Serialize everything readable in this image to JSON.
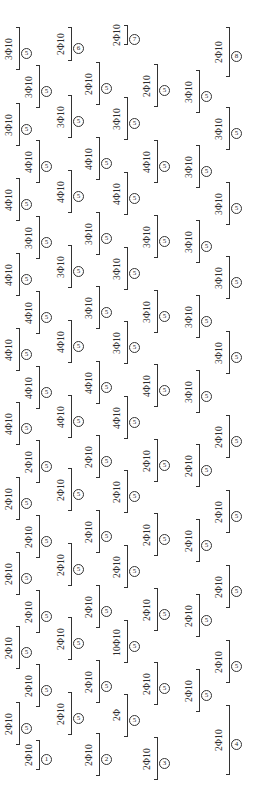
{
  "drawing": {
    "title": "",
    "bars": [
      {
        "x": 16,
        "y": 27,
        "h": 43,
        "label": "3Φ10",
        "mark": "5"
      },
      {
        "x": 36,
        "y": 65,
        "h": 43,
        "label": "3Φ10",
        "mark": "5"
      },
      {
        "x": 16,
        "y": 103,
        "h": 43,
        "label": "3Φ10",
        "mark": "5"
      },
      {
        "x": 36,
        "y": 140,
        "h": 43,
        "label": "4Φ10",
        "mark": "5"
      },
      {
        "x": 16,
        "y": 178,
        "h": 43,
        "label": "4Φ10",
        "mark": "5"
      },
      {
        "x": 36,
        "y": 216,
        "h": 43,
        "label": "3Φ10",
        "mark": "5"
      },
      {
        "x": 16,
        "y": 253,
        "h": 43,
        "label": "4Φ10",
        "mark": "5"
      },
      {
        "x": 36,
        "y": 291,
        "h": 43,
        "label": "4Φ10",
        "mark": "5"
      },
      {
        "x": 16,
        "y": 328,
        "h": 43,
        "label": "4Φ10",
        "mark": "5"
      },
      {
        "x": 36,
        "y": 366,
        "h": 43,
        "label": "4Φ10",
        "mark": "5"
      },
      {
        "x": 16,
        "y": 402,
        "h": 43,
        "label": "4Φ10",
        "mark": "5"
      },
      {
        "x": 36,
        "y": 440,
        "h": 43,
        "label": "2Φ10",
        "mark": "5"
      },
      {
        "x": 16,
        "y": 477,
        "h": 43,
        "label": "2Φ10",
        "mark": "5"
      },
      {
        "x": 36,
        "y": 515,
        "h": 43,
        "label": "2Φ10",
        "mark": "5"
      },
      {
        "x": 16,
        "y": 552,
        "h": 43,
        "label": "2Φ10",
        "mark": "5"
      },
      {
        "x": 36,
        "y": 590,
        "h": 43,
        "label": "2Φ10",
        "mark": "5"
      },
      {
        "x": 16,
        "y": 626,
        "h": 43,
        "label": "2Φ10",
        "mark": "5"
      },
      {
        "x": 36,
        "y": 664,
        "h": 43,
        "label": "2Φ10",
        "mark": "5"
      },
      {
        "x": 16,
        "y": 702,
        "h": 43,
        "label": "2Φ10",
        "mark": "5"
      },
      {
        "x": 36,
        "y": 740,
        "h": 30,
        "label": "2Φ10",
        "mark": "1"
      },
      {
        "x": 68,
        "y": 27,
        "h": 34,
        "label": "2Φ10",
        "mark": "6"
      },
      {
        "x": 68,
        "y": 95,
        "h": 43,
        "label": "3Φ10",
        "mark": "5"
      },
      {
        "x": 68,
        "y": 170,
        "h": 43,
        "label": "4Φ10",
        "mark": "5"
      },
      {
        "x": 68,
        "y": 245,
        "h": 43,
        "label": "3Φ10",
        "mark": "5"
      },
      {
        "x": 68,
        "y": 320,
        "h": 43,
        "label": "4Φ10",
        "mark": "5"
      },
      {
        "x": 68,
        "y": 395,
        "h": 43,
        "label": "4Φ10",
        "mark": "5"
      },
      {
        "x": 68,
        "y": 468,
        "h": 43,
        "label": "2Φ10",
        "mark": "5"
      },
      {
        "x": 68,
        "y": 543,
        "h": 43,
        "label": "2Φ10",
        "mark": "5"
      },
      {
        "x": 68,
        "y": 617,
        "h": 43,
        "label": "2Φ10",
        "mark": "5"
      },
      {
        "x": 68,
        "y": 692,
        "h": 43,
        "label": "2Φ10",
        "mark": "5"
      },
      {
        "x": 96,
        "y": 62,
        "h": 43,
        "label": "2Φ10",
        "mark": "5"
      },
      {
        "x": 96,
        "y": 137,
        "h": 43,
        "label": "4Φ10",
        "mark": "5"
      },
      {
        "x": 96,
        "y": 212,
        "h": 43,
        "label": "3Φ10",
        "mark": "5"
      },
      {
        "x": 96,
        "y": 286,
        "h": 43,
        "label": "3Φ10",
        "mark": "5"
      },
      {
        "x": 96,
        "y": 361,
        "h": 43,
        "label": "4Φ10",
        "mark": "5"
      },
      {
        "x": 96,
        "y": 435,
        "h": 43,
        "label": "2Φ10",
        "mark": "5"
      },
      {
        "x": 96,
        "y": 510,
        "h": 43,
        "label": "2Φ10",
        "mark": "5"
      },
      {
        "x": 96,
        "y": 585,
        "h": 43,
        "label": "2Φ10",
        "mark": "5"
      },
      {
        "x": 96,
        "y": 660,
        "h": 43,
        "label": "2Φ10",
        "mark": "5"
      },
      {
        "x": 96,
        "y": 733,
        "h": 43,
        "label": "2Φ10",
        "mark": "2"
      },
      {
        "x": 124,
        "y": 25,
        "h": 20,
        "label": "2Φ10",
        "mark": "7"
      },
      {
        "x": 124,
        "y": 97,
        "h": 43,
        "label": "3Φ10",
        "mark": "5"
      },
      {
        "x": 124,
        "y": 172,
        "h": 43,
        "label": "4Φ10",
        "mark": "5"
      },
      {
        "x": 124,
        "y": 247,
        "h": 43,
        "label": "3Φ10",
        "mark": "5"
      },
      {
        "x": 124,
        "y": 321,
        "h": 43,
        "label": "3Φ10",
        "mark": "5"
      },
      {
        "x": 124,
        "y": 396,
        "h": 43,
        "label": "4Φ10",
        "mark": "5"
      },
      {
        "x": 124,
        "y": 470,
        "h": 43,
        "label": "2Φ10",
        "mark": "5"
      },
      {
        "x": 124,
        "y": 545,
        "h": 43,
        "label": "2Φ10",
        "mark": "5"
      },
      {
        "x": 124,
        "y": 620,
        "h": 43,
        "label": "10Φ10",
        "mark": "5"
      },
      {
        "x": 124,
        "y": 694,
        "h": 43,
        "label": "2Φ",
        "mark": "5"
      },
      {
        "x": 154,
        "y": 64,
        "h": 43,
        "label": "2Φ10",
        "mark": "5"
      },
      {
        "x": 154,
        "y": 140,
        "h": 43,
        "label": "4Φ10",
        "mark": "5"
      },
      {
        "x": 154,
        "y": 215,
        "h": 43,
        "label": "3Φ10",
        "mark": "5"
      },
      {
        "x": 154,
        "y": 290,
        "h": 43,
        "label": "3Φ10",
        "mark": "5"
      },
      {
        "x": 154,
        "y": 364,
        "h": 43,
        "label": "4Φ10",
        "mark": "5"
      },
      {
        "x": 154,
        "y": 439,
        "h": 43,
        "label": "2Φ10",
        "mark": "5"
      },
      {
        "x": 154,
        "y": 513,
        "h": 43,
        "label": "2Φ10",
        "mark": "5"
      },
      {
        "x": 154,
        "y": 588,
        "h": 43,
        "label": "2Φ10",
        "mark": "5"
      },
      {
        "x": 154,
        "y": 662,
        "h": 43,
        "label": "2Φ10",
        "mark": "5"
      },
      {
        "x": 154,
        "y": 737,
        "h": 43,
        "label": "2Φ10",
        "mark": "3"
      },
      {
        "x": 196,
        "y": 70,
        "h": 43,
        "label": "3Φ10",
        "mark": "5"
      },
      {
        "x": 196,
        "y": 145,
        "h": 43,
        "label": "3Φ10",
        "mark": "5"
      },
      {
        "x": 196,
        "y": 220,
        "h": 43,
        "label": "3Φ10",
        "mark": "5"
      },
      {
        "x": 196,
        "y": 295,
        "h": 43,
        "label": "3Φ10",
        "mark": "5"
      },
      {
        "x": 196,
        "y": 370,
        "h": 43,
        "label": "3Φ10",
        "mark": "5"
      },
      {
        "x": 196,
        "y": 444,
        "h": 43,
        "label": "2Φ10",
        "mark": "5"
      },
      {
        "x": 196,
        "y": 519,
        "h": 43,
        "label": "2Φ10",
        "mark": "5"
      },
      {
        "x": 196,
        "y": 594,
        "h": 43,
        "label": "2Φ10",
        "mark": "5"
      },
      {
        "x": 196,
        "y": 669,
        "h": 43,
        "label": "2Φ10",
        "mark": "5"
      },
      {
        "x": 226,
        "y": 27,
        "h": 50,
        "label": "2Φ10",
        "mark": "8"
      },
      {
        "x": 226,
        "y": 107,
        "h": 43,
        "label": "3Φ10",
        "mark": "5"
      },
      {
        "x": 226,
        "y": 182,
        "h": 43,
        "label": "3Φ10",
        "mark": "5"
      },
      {
        "x": 226,
        "y": 256,
        "h": 43,
        "label": "3Φ10",
        "mark": "5"
      },
      {
        "x": 226,
        "y": 331,
        "h": 43,
        "label": "3Φ10",
        "mark": "5"
      },
      {
        "x": 226,
        "y": 415,
        "h": 43,
        "label": "2Φ10",
        "mark": "5"
      },
      {
        "x": 226,
        "y": 490,
        "h": 43,
        "label": "2Φ10",
        "mark": "5"
      },
      {
        "x": 226,
        "y": 565,
        "h": 43,
        "label": "2Φ10",
        "mark": "5"
      },
      {
        "x": 226,
        "y": 640,
        "h": 43,
        "label": "2Φ10",
        "mark": "5"
      },
      {
        "x": 226,
        "y": 705,
        "h": 70,
        "label": "2Φ10",
        "mark": "4"
      }
    ],
    "mark_legend": {
      "circle_symbols": [
        "①",
        "②",
        "③",
        "④",
        "⑤",
        "⑥",
        "⑦",
        "⑧"
      ]
    }
  }
}
